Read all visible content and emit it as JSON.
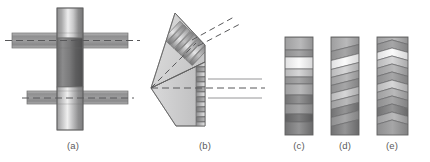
{
  "figure": {
    "kind": "technical-line-diagram",
    "background_color": "#ffffff",
    "width": 430,
    "height": 162,
    "caption_color": "#5a5a5a",
    "outline_color": "#6e6e6e",
    "centerline_color": "#58585a",
    "leader_color": "#8a8a8c",
    "panels": [
      {
        "id": "a",
        "label": "(a)",
        "label_x": 73,
        "label_y": 140,
        "description": "Vertical gradient-shaded disc intersected by two horizontal gradient-shaded bars with dashed centerlines",
        "parts": [
          {
            "name": "vertical-disc",
            "x": 57,
            "y": 8,
            "w": 26,
            "h": 122
          },
          {
            "name": "upper-horizontal-bar",
            "x": 12,
            "y": 33,
            "w": 116,
            "h": 15
          },
          {
            "name": "lower-horizontal-bar",
            "x": 27,
            "y": 91,
            "w": 101,
            "h": 13
          },
          {
            "name": "upper-centerline",
            "y": 40
          },
          {
            "name": "lower-centerline",
            "y": 98
          }
        ]
      },
      {
        "id": "b",
        "label": "(b)",
        "label_x": 205,
        "label_y": 140,
        "description": "Folded fan / wedge-shaped stack of laminations in perspective with dashed axes and two leader lines",
        "parts": [
          {
            "name": "upper-wedge-fan",
            "blades": 7
          },
          {
            "name": "lower-wedge-fan",
            "blades": 13
          },
          {
            "name": "upper-dashed-axis"
          },
          {
            "name": "lower-dashed-axis"
          },
          {
            "name": "leader-line-upper"
          },
          {
            "name": "leader-line-lower"
          }
        ]
      },
      {
        "id": "c",
        "label": "(c)",
        "label_x": 299,
        "label_y": 140,
        "description": "Vertical rectangular stack with straight horizontal bands of varying gray gradient",
        "rect": {
          "x": 285,
          "y": 37,
          "w": 28,
          "h": 98
        },
        "bands": 10
      },
      {
        "id": "d",
        "label": "(d)",
        "label_x": 345,
        "label_y": 140,
        "description": "Vertical rectangular stack with slanted/oblique bands of varying gray gradient",
        "rect": {
          "x": 331,
          "y": 37,
          "w": 28,
          "h": 98
        },
        "bands": 11
      },
      {
        "id": "e",
        "label": "(e)",
        "label_x": 392,
        "label_y": 140,
        "description": "Vertical rectangular stack with chevron / herringbone bands of varying gray gradient",
        "rect": {
          "x": 377,
          "y": 37,
          "w": 31,
          "h": 98
        },
        "bands": 12
      }
    ]
  }
}
